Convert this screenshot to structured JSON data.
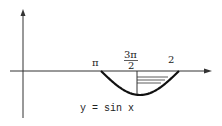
{
  "diagram": {
    "caption": "y = sin x",
    "labels": {
      "pi": "π",
      "three_pi_over_two_num": "3π",
      "three_pi_over_two_den": "2",
      "two_pi": "2"
    },
    "curve": {
      "function": "sin x",
      "x_start": "π",
      "x_end": "2π",
      "shaded_region": [
        "3π/2",
        "2π"
      ]
    },
    "colors": {
      "ink": "#222222",
      "background": "#ffffff"
    }
  }
}
